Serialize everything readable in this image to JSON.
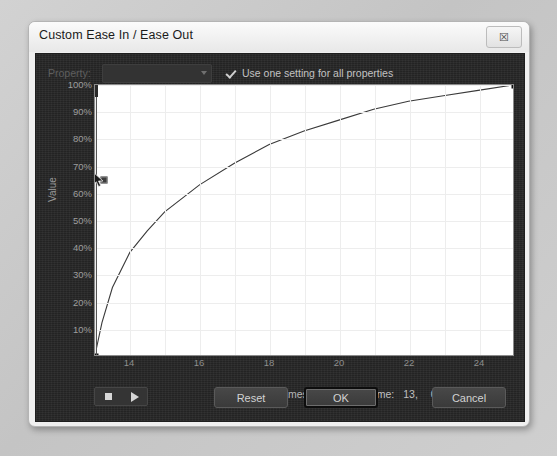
{
  "window": {
    "title": "Custom Ease In / Ease Out",
    "close_icon": "close-icon",
    "close_glyph": "☒"
  },
  "options": {
    "property_label": "Property:",
    "property_value": "",
    "use_one_setting_label": "Use one setting for all properties",
    "use_one_setting_checked": true
  },
  "graph": {
    "value_axis_title": "Value",
    "frames_axis_title": "Frames",
    "y_tick_labels": [
      "100%",
      "90%",
      "80%",
      "70%",
      "60%",
      "50%",
      "40%",
      "30%",
      "20%",
      "10%"
    ],
    "x_tick_labels": [
      "14",
      "16",
      "18",
      "20",
      "22",
      "24"
    ]
  },
  "transport": {
    "stop_icon": "stop-icon",
    "play_icon": "play-icon"
  },
  "status": {
    "frame_label": "Frame:",
    "frame_value": "13,",
    "percent_value": "0%"
  },
  "actions": {
    "reset_label": "Reset",
    "ok_label": "OK",
    "cancel_label": "Cancel"
  },
  "colors": {
    "panel_background": "#272727",
    "plot_background": "#ffffff",
    "curve": "#3a3a3a",
    "grid": "#ededed",
    "dialog_frame": "#efefef"
  },
  "chart_data": {
    "type": "line",
    "title": "Custom Ease In / Ease Out",
    "xlabel": "Frames",
    "ylabel": "Value",
    "xlim": [
      13,
      25
    ],
    "ylim": [
      0,
      100
    ],
    "grid": true,
    "legend": "none",
    "x_ticks": [
      14,
      16,
      18,
      20,
      22,
      24
    ],
    "y_ticks": [
      10,
      20,
      30,
      40,
      50,
      60,
      70,
      80,
      90,
      100
    ],
    "series": [
      {
        "name": "Ease curve",
        "x": [
          13.0,
          13.2,
          13.5,
          14.0,
          14.5,
          15.0,
          15.5,
          16.0,
          17.0,
          18.0,
          19.0,
          20.0,
          21.0,
          22.0,
          23.0,
          24.0,
          25.0
        ],
        "values": [
          0,
          12,
          25,
          38,
          46,
          53,
          58,
          63,
          71,
          78,
          83,
          87,
          91,
          94,
          96,
          98,
          100
        ]
      }
    ],
    "control_points": [
      {
        "name": "start-point",
        "x": 13.0,
        "y": 0
      },
      {
        "name": "end-point",
        "x": 25.0,
        "y": 100
      }
    ],
    "handles": [
      {
        "name": "mid-handle",
        "x": 13.25,
        "y": 65
      }
    ],
    "playhead": {
      "x": 13.0,
      "label": "Frame: 13, 0%"
    }
  }
}
